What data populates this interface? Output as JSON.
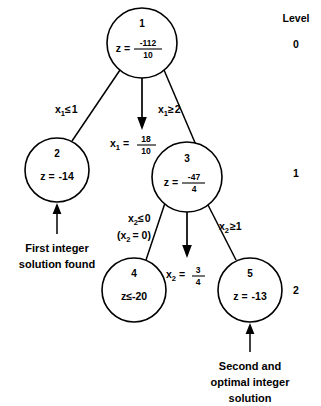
{
  "diagram": {
    "title_column": {
      "header": "Level",
      "levels": [
        "0",
        "1",
        "2"
      ]
    },
    "nodes": [
      {
        "id": "1",
        "value_prefix": "z =",
        "value_type": "fraction",
        "numerator": "-112",
        "denominator": "10",
        "level": "0"
      },
      {
        "id": "2",
        "value_prefix": "z =",
        "value_type": "plain",
        "value": "-14",
        "level": "1"
      },
      {
        "id": "3",
        "value_prefix": "z =",
        "value_type": "fraction",
        "numerator": "-47",
        "denominator": "4",
        "level": "1"
      },
      {
        "id": "4",
        "value_prefix": "z",
        "value_type": "inequality",
        "relation": "≤",
        "value": "-20",
        "level": "2"
      },
      {
        "id": "5",
        "value_prefix": "z =",
        "value_type": "plain",
        "value": "-13",
        "level": "2"
      }
    ],
    "edges": [
      {
        "from": "1",
        "to": "2",
        "var": "x",
        "subscript": "1",
        "relation": "≤",
        "bound": "1"
      },
      {
        "from": "1",
        "to": "3",
        "var": "x",
        "subscript": "1",
        "relation": "≥",
        "bound": "2"
      },
      {
        "from": "3",
        "to": "4",
        "var": "x",
        "subscript": "2",
        "relation": "≤",
        "bound": "0",
        "note_open": "(x",
        "note_sub": "2",
        "note_close": "= 0)"
      },
      {
        "from": "3",
        "to": "5",
        "var": "x",
        "subscript": "2",
        "relation": "≥",
        "bound": "1"
      }
    ],
    "branch_arrows": [
      {
        "parent": "1",
        "var": "x",
        "subscript": "1",
        "equals": "=",
        "numerator": "18",
        "denominator": "10"
      },
      {
        "parent": "3",
        "var": "x",
        "subscript": "2",
        "equals": "=",
        "numerator": "3",
        "denominator": "4"
      }
    ],
    "annotations": [
      {
        "target": "2",
        "lines": [
          "First integer",
          "solution found"
        ]
      },
      {
        "target": "5",
        "lines": [
          "Second and",
          "optimal integer",
          "solution"
        ]
      }
    ],
    "colors": {
      "stroke": "#000000",
      "fill": "#ffffff",
      "text": "#000000"
    }
  }
}
